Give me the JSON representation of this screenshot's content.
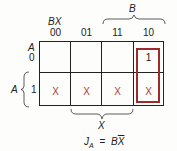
{
  "kmap": {
    "row_var": "A",
    "col_vars": "BX",
    "col_headers": [
      "00",
      "01",
      "11",
      "10"
    ],
    "row_headers": [
      "0",
      "1"
    ],
    "cells": [
      [
        "",
        "",
        "",
        "1"
      ],
      [
        "X",
        "X",
        "X",
        "X"
      ]
    ],
    "brace_top_label": "B",
    "brace_left_label": "A",
    "brace_bottom_label": "X",
    "corner_row_label": "A",
    "group_color": "#9e2a2a",
    "dont_care_color": "#b03a3a"
  },
  "equation": {
    "lhs": "J",
    "lhs_sub": "A",
    "eq": "=",
    "rhs_b": "B",
    "rhs_xbar": "X"
  }
}
